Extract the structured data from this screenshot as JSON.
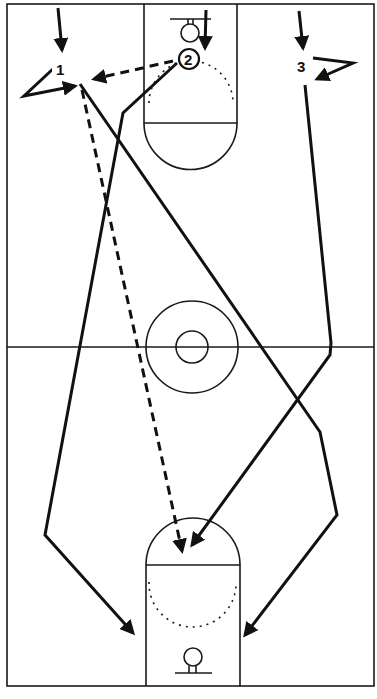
{
  "diagram": {
    "court": {
      "line_color": "#1a1a1a",
      "background": "#ffffff"
    },
    "players": [
      {
        "label": "1",
        "x": 62,
        "y": 70
      },
      {
        "label": "2",
        "x": 189,
        "y": 60
      },
      {
        "label": "3",
        "x": 303,
        "y": 65
      }
    ],
    "paths": [
      {
        "player": "1",
        "type": "cut",
        "style": "solid"
      },
      {
        "player": "2",
        "type": "cut",
        "style": "solid"
      },
      {
        "player": "3",
        "type": "cut",
        "style": "solid"
      },
      {
        "from": "2",
        "to": "1",
        "type": "pass",
        "style": "dashed"
      },
      {
        "from": "1",
        "type": "pass",
        "style": "dashed"
      }
    ]
  }
}
